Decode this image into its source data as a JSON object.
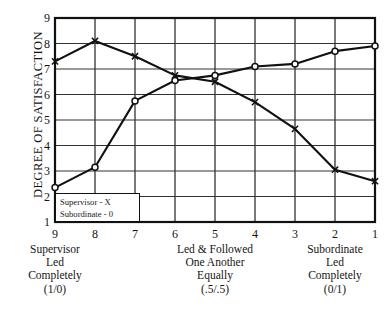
{
  "chart_data": {
    "type": "line",
    "title": "",
    "xlabel": "",
    "ylabel": "DEGREE OF SATISFACTION",
    "x": [
      9,
      8,
      7,
      6,
      5,
      4,
      3,
      2,
      1
    ],
    "xtick_labels": [
      "9",
      "8",
      "7",
      "6",
      "5",
      "4",
      "3",
      "2",
      "1"
    ],
    "ytick_labels": [
      "9",
      "8",
      "7",
      "6",
      "5",
      "4",
      "3",
      "2",
      "1"
    ],
    "xlim": [
      9,
      1
    ],
    "ylim": [
      1,
      9
    ],
    "grid": true,
    "legend_position": "bottom-left",
    "series": [
      {
        "name": "Supervisor - X",
        "marker": "X",
        "values": [
          7.3,
          8.1,
          7.5,
          6.75,
          6.5,
          5.7,
          4.65,
          3.05,
          2.6
        ]
      },
      {
        "name": "Subordinate - 0",
        "marker": "0",
        "values": [
          2.35,
          3.15,
          5.75,
          6.55,
          6.75,
          7.1,
          7.2,
          7.7,
          7.9
        ]
      }
    ],
    "group_captions": [
      {
        "at_x": 9,
        "lines": [
          "Supervisor",
          "Led",
          "Completely",
          "(1/0)"
        ]
      },
      {
        "at_x": 5,
        "lines": [
          "Led & Followed",
          "One Another",
          "Equally",
          "(.5/.5)"
        ]
      },
      {
        "at_x": 2,
        "lines": [
          "Subordinate",
          "Led",
          "Completely",
          "(0/1)"
        ]
      }
    ]
  },
  "legend": {
    "entries": [
      {
        "label": "Supervisor - X"
      },
      {
        "label": "Subordinate - 0"
      }
    ]
  },
  "colors": {
    "line": "#111111",
    "frame": "#111111",
    "grid": "#333333",
    "background": "#ffffff"
  }
}
